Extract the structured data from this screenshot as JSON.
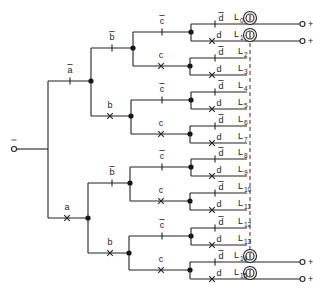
{
  "diagram": {
    "input_terminal": {
      "label": ""
    },
    "level_a": {
      "upper": "a",
      "upper_negated": true,
      "lower": "a",
      "lower_negated": false
    },
    "level_b": {
      "upper": "b",
      "upper_negated": true,
      "lower": "b",
      "lower_negated": false
    },
    "level_c": {
      "upper": "c",
      "upper_negated": true,
      "lower": "c",
      "lower_negated": false
    },
    "level_d": {
      "upper": "d",
      "upper_negated": true,
      "lower": "d",
      "lower_negated": false
    },
    "outputs": [
      {
        "id": "L",
        "sub": "0"
      },
      {
        "id": "L",
        "sub": "1"
      },
      {
        "id": "L",
        "sub": "2"
      },
      {
        "id": "L",
        "sub": "3"
      },
      {
        "id": "L",
        "sub": "4"
      },
      {
        "id": "L",
        "sub": "5"
      },
      {
        "id": "L",
        "sub": "6"
      },
      {
        "id": "L",
        "sub": "7"
      },
      {
        "id": "L",
        "sub": "8"
      },
      {
        "id": "L",
        "sub": "9"
      },
      {
        "id": "L",
        "sub": "10"
      },
      {
        "id": "L",
        "sub": "11"
      },
      {
        "id": "L",
        "sub": "12"
      },
      {
        "id": "L",
        "sub": "13"
      },
      {
        "id": "L",
        "sub": "14"
      },
      {
        "id": "L",
        "sub": "15"
      }
    ],
    "lamps_shown_on": [
      "L0",
      "L1",
      "L14",
      "L15"
    ],
    "supply_terminal_label": "+",
    "legend": {
      "open_contact_symbol": "|",
      "closed_contact_symbol": "X"
    }
  }
}
